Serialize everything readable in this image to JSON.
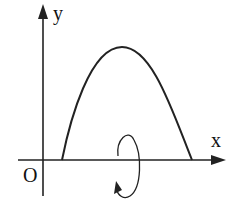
{
  "diagram": {
    "type": "solid-of-revolution sketch",
    "axes": {
      "x_label": "x",
      "y_label": "y",
      "origin_label": "O"
    },
    "curve": {
      "shape": "parabola-like arch above x-axis",
      "description": "Arch rising from x-axis to a peak and falling back to x-axis"
    },
    "rotation": {
      "axis": "x",
      "description": "Circular arrow around x-axis indicating rotation"
    },
    "colors": {
      "stroke": "#222222",
      "background": "#ffffff"
    }
  }
}
